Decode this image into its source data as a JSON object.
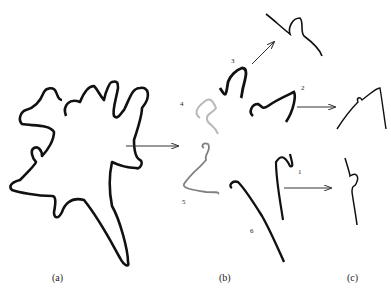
{
  "panels": {
    "a": {
      "label": "(a)"
    },
    "b": {
      "label": "(b)"
    },
    "c": {
      "label": "(c)"
    }
  },
  "segment_numbers": [
    "1",
    "2",
    "3",
    "4",
    "5",
    "6"
  ],
  "colors": {
    "stroke": "#111111",
    "segment4": "#b8b8b8",
    "segment5": "#808080",
    "arrow": "#333333"
  }
}
